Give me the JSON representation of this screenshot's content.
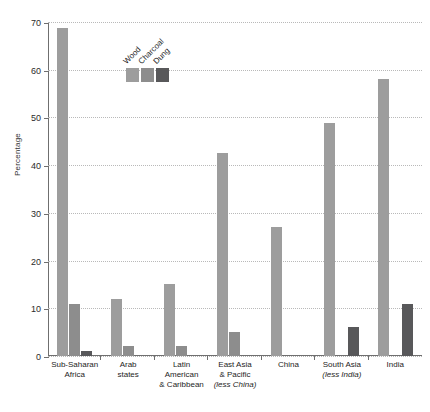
{
  "chart_data": {
    "type": "bar",
    "title": "",
    "xlabel": "",
    "ylabel": "Percentage",
    "ylim": [
      0,
      70
    ],
    "ytick_step": 10,
    "yticks": [
      0,
      10,
      20,
      30,
      40,
      50,
      60,
      70
    ],
    "grid": true,
    "legend_position": "inside-top-left",
    "categories": [
      "Sub-Saharan Africa",
      "Arab states",
      "Latin American & Caribbean",
      "East Asia & Pacific (less China)",
      "China",
      "South Asia (less India)",
      "India"
    ],
    "series": [
      {
        "name": "Wood",
        "color": "#9d9d9d",
        "values": [
          68.8,
          12.0,
          15.0,
          42.6,
          27.0,
          48.8,
          58.0
        ]
      },
      {
        "name": "Charcoal",
        "color": "#8d8d8d",
        "values": [
          11.0,
          2.0,
          2.0,
          5.0,
          0.0,
          0.0,
          0.0
        ]
      },
      {
        "name": "Dung",
        "color": "#58585a",
        "values": [
          1.0,
          0.0,
          0.0,
          0.0,
          0.0,
          6.0,
          11.0
        ]
      }
    ]
  },
  "axis": {
    "y_title": "Percentage",
    "y_tick_labels": [
      "70",
      "60",
      "50",
      "40",
      "30",
      "20",
      "10",
      "0"
    ]
  },
  "xcategories": [
    {
      "line1": "Sub-Saharan",
      "line2": "Africa",
      "line3": ""
    },
    {
      "line1": "Arab",
      "line2": "states",
      "line3": ""
    },
    {
      "line1": "Latin American",
      "line2": "& Caribbean",
      "line3": ""
    },
    {
      "line1": "East Asia",
      "line2": "& Pacific",
      "line3": "(less China)"
    },
    {
      "line1": "China",
      "line2": "",
      "line3": ""
    },
    {
      "line1": "South Asia",
      "line2": "(less India)",
      "line3": ""
    },
    {
      "line1": "India",
      "line2": "",
      "line3": ""
    }
  ],
  "legend": {
    "items": [
      {
        "label": "Wood",
        "color": "#9d9d9d"
      },
      {
        "label": "Charcoal",
        "color": "#8d8d8d"
      },
      {
        "label": "Dung",
        "color": "#58585a"
      }
    ]
  }
}
